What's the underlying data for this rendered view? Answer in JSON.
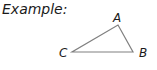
{
  "title": "Example:",
  "triangle": {
    "stroke": "#808080",
    "vertices": [
      {
        "label": "A",
        "x": 118,
        "y": 25
      },
      {
        "label": "B",
        "x": 133,
        "y": 52
      },
      {
        "label": "C",
        "x": 72,
        "y": 52
      }
    ]
  }
}
